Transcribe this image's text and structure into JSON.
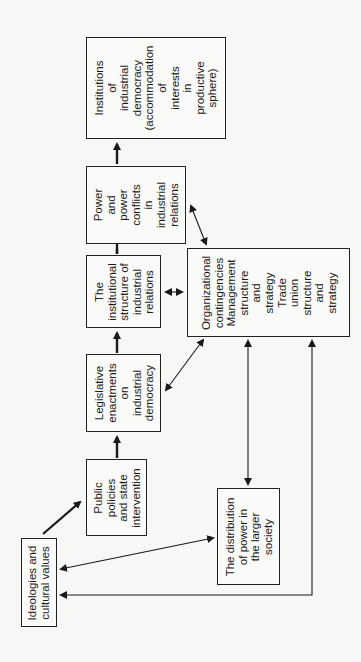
{
  "diagram": {
    "orientation": "rotated-90-ccw",
    "nodes": {
      "institutions": {
        "label": "Institutions\nof\nindustrial\ndemocracy\n(accommodation\nof\ninterests\nin\nproductive\nsphere)"
      },
      "power": {
        "label": "Power\nand\npower\nconflicts\nin\nindustrial\nrelations"
      },
      "institutional_structure": {
        "label": "The\ninstitutional\nstructure of\nindustrial\nrelations"
      },
      "legislative": {
        "label": "Legislative\nenactments\non\nindustrial\ndemocracy"
      },
      "public_policies": {
        "label": "Public\npolicies\nand state\nintervention"
      },
      "ideologies": {
        "label": "Ideologies and\ncultural values"
      },
      "organizational": {
        "label": "Organizational\ncontingencies\nManagement\nstructure\nand\nstrategy\nTrade\nunion\nstructure\nand\nstrategy"
      },
      "distribution": {
        "label": "The distribution\nof power in\nthe larger\nsociety"
      }
    },
    "edges": [
      {
        "from": "ideologies",
        "to": "public_policies",
        "type": "bold-arrow"
      },
      {
        "from": "public_policies",
        "to": "legislative",
        "type": "bold-arrow"
      },
      {
        "from": "legislative",
        "to": "institutional_structure",
        "type": "bold-arrow"
      },
      {
        "from": "institutional_structure",
        "to": "power",
        "type": "bold-arrow"
      },
      {
        "from": "power",
        "to": "institutions",
        "type": "bold-arrow"
      },
      {
        "from": "institutional_structure",
        "to": "organizational",
        "type": "double-arrow"
      },
      {
        "from": "legislative",
        "to": "organizational",
        "type": "double-arrow"
      },
      {
        "from": "power",
        "to": "organizational",
        "type": "double-arrow"
      },
      {
        "from": "ideologies",
        "to": "distribution",
        "type": "double-arrow"
      },
      {
        "from": "distribution",
        "to": "organizational",
        "type": "double-arrow"
      },
      {
        "from": "ideologies",
        "to": "organizational",
        "type": "double-arrow-elbow"
      }
    ]
  }
}
